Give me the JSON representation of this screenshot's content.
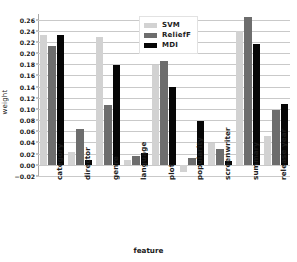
{
  "chart_data": {
    "type": "bar",
    "title": "",
    "xlabel": "feature",
    "ylabel": "weight",
    "categories": [
      "category",
      "director",
      "genre",
      "language",
      "plot",
      "popularity",
      "screenwriter",
      "summary",
      "release year"
    ],
    "series": [
      {
        "name": "SVM",
        "color": "#d2d2d2",
        "values": [
          0.232,
          0.023,
          0.228,
          0.009,
          0.179,
          -0.013,
          0.039,
          0.239,
          0.052
        ]
      },
      {
        "name": "ReliefF",
        "color": "#6d6d6d",
        "values": [
          0.213,
          0.064,
          0.108,
          0.016,
          0.185,
          0.013,
          0.028,
          0.264,
          0.098
        ]
      },
      {
        "name": "MDI",
        "color": "#060606",
        "values": [
          0.233,
          0.008,
          0.178,
          0.022,
          0.139,
          0.079,
          0.007,
          0.216,
          0.109
        ]
      }
    ],
    "ylim": [
      -0.02,
      0.27
    ],
    "ytick_values": [
      -0.02,
      0.0,
      0.02,
      0.04,
      0.06,
      0.08,
      0.1,
      0.12,
      0.14,
      0.16,
      0.18,
      0.2,
      0.22,
      0.24,
      0.26
    ],
    "ytick_labels": [
      "−0.02",
      "0.00",
      "0.02",
      "0.04",
      "0.06",
      "0.08",
      "0.10",
      "0.12",
      "0.14",
      "0.16",
      "0.18",
      "0.20",
      "0.22",
      "0.24",
      "0.26"
    ],
    "grid": true,
    "legend_position": "top-center",
    "legend_entries": [
      "SVM",
      "ReliefF",
      "MDI"
    ]
  }
}
